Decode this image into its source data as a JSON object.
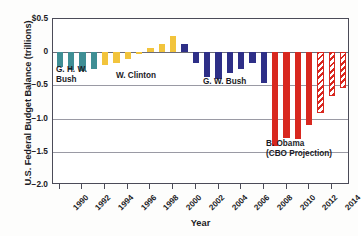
{
  "chart_data": {
    "type": "bar",
    "title": "",
    "xlabel": "Year",
    "ylabel": "U.S. Federal Budget Balance (trillions)",
    "ylim": [
      -2.0,
      0.5
    ],
    "xlim": [
      1989.4,
      2015.6
    ],
    "grid": true,
    "legend": "none",
    "y_ticks": [
      "$0.5",
      "0",
      "−0.5",
      "−1.0",
      "−1.5",
      "−2.0"
    ],
    "y_tick_values": [
      0.5,
      0,
      -0.5,
      -1.0,
      -1.5,
      -2.0
    ],
    "x_ticks": [
      "1990",
      "1992",
      "1994",
      "1996",
      "1998",
      "2000",
      "2002",
      "2004",
      "2006",
      "2008",
      "2010",
      "2012",
      "2014"
    ],
    "x_tick_values": [
      1990,
      1992,
      1994,
      1996,
      1998,
      2000,
      2002,
      2004,
      2006,
      2008,
      2010,
      2012,
      2014
    ],
    "categories": [
      1990,
      1991,
      1992,
      1993,
      1994,
      1995,
      1996,
      1997,
      1998,
      1999,
      2000,
      2001,
      2002,
      2003,
      2004,
      2005,
      2006,
      2007,
      2008,
      2009,
      2010,
      2011,
      2012,
      2013,
      2014,
      2015
    ],
    "values": [
      -0.22,
      -0.27,
      -0.29,
      -0.26,
      -0.2,
      -0.16,
      -0.11,
      -0.02,
      0.07,
      0.13,
      0.24,
      0.13,
      -0.16,
      -0.38,
      -0.41,
      -0.32,
      -0.25,
      -0.16,
      -0.46,
      -1.41,
      -1.29,
      -1.3,
      -1.09,
      -0.92,
      -0.66,
      -0.54
    ],
    "bar_groups": [
      {
        "name": "G. H. W. Bush",
        "color": "#3f8f95",
        "style": "solid",
        "years": [
          1990,
          1991,
          1992,
          1993
        ]
      },
      {
        "name": "W. Clinton",
        "color": "#f2c43c",
        "style": "solid",
        "years": [
          1994,
          1995,
          1996,
          1997,
          1998,
          1999,
          2000
        ]
      },
      {
        "name": "G. W. Bush",
        "color": "#2e2f87",
        "style": "solid",
        "years": [
          2001,
          2002,
          2003,
          2004,
          2005,
          2006,
          2007,
          2008
        ]
      },
      {
        "name": "B. Obama",
        "color": "#d8281f",
        "style": "solid",
        "years": [
          2009,
          2010,
          2011,
          2012
        ]
      },
      {
        "name": "B. Obama (CBO Projection)",
        "color": "#d8281f",
        "style": "hatched",
        "years": [
          2013,
          2014,
          2015
        ]
      }
    ],
    "annotations": [
      {
        "id": "ghwbush",
        "text": "G. H. W.\nBush"
      },
      {
        "id": "clinton",
        "text": "W. Clinton"
      },
      {
        "id": "gwbush",
        "text": "G. W. Bush"
      },
      {
        "id": "obama",
        "text": "B. Obama\n(CBO Projection)"
      }
    ],
    "colors": {
      "ghw_bush": "#3f8f95",
      "clinton": "#f2c43c",
      "gw_bush": "#2e2f87",
      "obama": "#d8281f",
      "axis": "#1b1b25",
      "grid": "#9a9aa4",
      "background": "#ffffff"
    }
  }
}
